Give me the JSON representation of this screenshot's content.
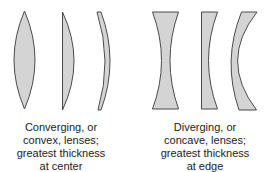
{
  "figure": {
    "colors": {
      "lens_fill": "#d4d4d4",
      "lens_stroke": "#4a4a4a",
      "text": "#222222",
      "background": "#ffffff"
    },
    "groups": [
      {
        "id": "converging",
        "lenses": [
          "biconvex",
          "plano-convex",
          "convex-meniscus"
        ],
        "caption_lines": [
          "Converging, or",
          "convex, lenses;",
          "greatest thickness",
          "at center"
        ]
      },
      {
        "id": "diverging",
        "lenses": [
          "biconcave",
          "plano-concave",
          "concave-meniscus"
        ],
        "caption_lines": [
          "Diverging, or",
          "concave, lenses;",
          "greatest thickness",
          "at edge"
        ]
      }
    ]
  }
}
